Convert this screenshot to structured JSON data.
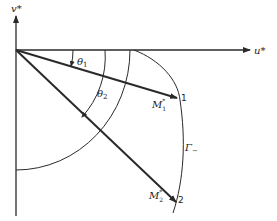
{
  "diagram": {
    "axes": {
      "horizontal_label": "u*",
      "vertical_label": "v*"
    },
    "angles": [
      {
        "label": "θ",
        "subscript": "1"
      },
      {
        "label": "θ",
        "subscript": "2"
      }
    ],
    "vectors": [
      {
        "label": "M",
        "subscript": "1",
        "superscript": "*",
        "endpoint": "1"
      },
      {
        "label": "M",
        "subscript": "2",
        "superscript": "*",
        "endpoint": "2"
      }
    ],
    "curve": {
      "label": "Γ",
      "subscript": "−"
    },
    "colors": {
      "stroke": "#2a2a2a",
      "background": "#ffffff"
    }
  }
}
